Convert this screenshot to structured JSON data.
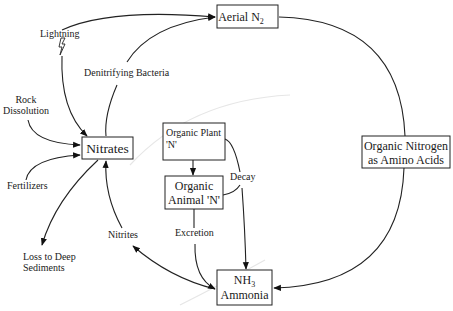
{
  "diagram": {
    "nodes": {
      "aerial_n2": {
        "label": "Aerial N",
        "subscript": "2"
      },
      "nitrates": {
        "label": "Nitrates"
      },
      "organic_plant": {
        "line1": "Organic Plant",
        "line2": "'N'"
      },
      "organic_animal": {
        "line1": "Organic",
        "line2": "Animal 'N'"
      },
      "organic_nitrogen": {
        "line1": "Organic Nitrogen",
        "line2": "as Amino Acids"
      },
      "ammonia": {
        "line1_prefix": "NH",
        "line1_subscript": "3",
        "line2": "Ammonia"
      }
    },
    "labels": {
      "lightning": "Lightning",
      "denitrifying_bacteria": "Denitrifying Bacteria",
      "rock_dissolution_1": "Rock",
      "rock_dissolution_2": "Dissolution",
      "fertilizers": "Fertilizers",
      "loss_1": "Loss to Deep",
      "loss_2": "Sediments",
      "nitrites": "Nitrites",
      "excretion": "Excretion",
      "decay": "Decay"
    },
    "edges": [
      {
        "from": "lightning",
        "to": "aerial_n2"
      },
      {
        "from": "lightning",
        "to": "nitrates"
      },
      {
        "from": "nitrates",
        "to": "aerial_n2",
        "via": "Denitrifying Bacteria"
      },
      {
        "from": "rock_dissolution",
        "to": "nitrates"
      },
      {
        "from": "fertilizers",
        "to": "nitrates"
      },
      {
        "from": "nitrates",
        "to": "loss_to_deep_sediments"
      },
      {
        "from": "ammonia",
        "to": "nitrates",
        "via": "Nitrites",
        "bidirectional": true
      },
      {
        "from": "organic_plant",
        "to": "organic_animal"
      },
      {
        "from": "organic_animal",
        "to": "ammonia",
        "via": "Excretion"
      },
      {
        "from": "organic_plant",
        "to": "ammonia",
        "via": "Decay"
      },
      {
        "from": "organic_animal",
        "to": "ammonia",
        "via": "Decay"
      },
      {
        "from": "aerial_n2",
        "to": "organic_nitrogen"
      },
      {
        "from": "organic_nitrogen",
        "to": "ammonia"
      }
    ]
  }
}
